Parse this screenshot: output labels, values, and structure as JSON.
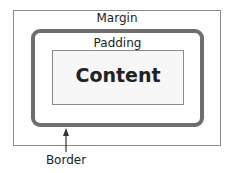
{
  "diagram": {
    "labels": {
      "margin": "Margin",
      "padding": "Padding",
      "content": "Content",
      "border": "Border"
    },
    "colors": {
      "border_stroke": "#6e6e6e",
      "box_outline": "#8a8a8a",
      "content_fill": "#f7f7f7"
    }
  }
}
